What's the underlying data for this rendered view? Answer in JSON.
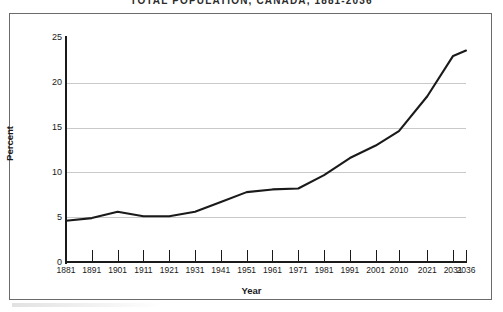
{
  "chart_data": {
    "type": "line",
    "title": "TOTAL POPULATION, CANADA, 1881-2036",
    "xlabel": "Year",
    "ylabel": "Percent",
    "categories": [
      "1881",
      "1891",
      "1901",
      "1911",
      "1921",
      "1931",
      "1941",
      "1951",
      "1961",
      "1971",
      "1981",
      "1991",
      "2001",
      "2010",
      "2021",
      "2031",
      "2036"
    ],
    "values": [
      4.6,
      4.9,
      5.6,
      5.1,
      5.1,
      5.6,
      6.7,
      7.8,
      8.1,
      8.2,
      9.7,
      11.6,
      13.0,
      14.6,
      18.5,
      23.0,
      23.6
    ],
    "ylim": [
      0,
      25
    ],
    "yticks": [
      "0",
      "5",
      "10",
      "15",
      "20",
      "25"
    ],
    "ytick_values": [
      0,
      5,
      10,
      15,
      20,
      25
    ],
    "gridlines_at": [
      5,
      10,
      15,
      20
    ],
    "grid": true,
    "legend": "none",
    "series_color": "#1a1a1a",
    "grid_color": "#c9c9c9",
    "axis_color": "#1a1a1a",
    "background": "#ffffff"
  },
  "frame": {
    "border_color": "#6b6b6b"
  }
}
